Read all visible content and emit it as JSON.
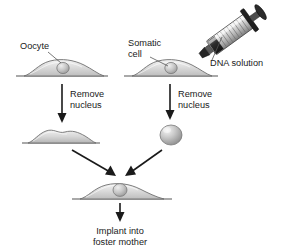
{
  "diagram": {
    "background_color": "#ffffff",
    "text_color": "#1a1a1a",
    "cell_fill_color": "#d5d5d5",
    "nucleus_fill_color": "#b8b8b8",
    "baseline_color": "#8d8d8d",
    "arrow_color": "#1a1a1a",
    "leader_color": "#555555"
  },
  "labels": {
    "oocyte": "Oocyte",
    "somatic_cell_line1": "Somatic",
    "somatic_cell_line2": "cell",
    "dna_solution": "DNA solution",
    "remove_nucleus_left_line1": "Remove",
    "remove_nucleus_left_line2": "nucleus",
    "remove_nucleus_right_line1": "Remove",
    "remove_nucleus_right_line2": "nucleus",
    "implant_line1": "Implant into",
    "implant_line2": "foster mother"
  },
  "steps": [
    {
      "id": "oocyte",
      "label": "Oocyte",
      "stage": "source-cell-left"
    },
    {
      "id": "somatic-cell",
      "label": "Somatic cell",
      "stage": "source-cell-right"
    },
    {
      "id": "dna-injection",
      "label": "DNA solution",
      "stage": "injection"
    },
    {
      "id": "enucleate-oocyte",
      "label": "Remove nucleus",
      "stage": "transition-left"
    },
    {
      "id": "enucleate-somatic",
      "label": "Remove nucleus",
      "stage": "transition-right"
    },
    {
      "id": "enucleated-oocyte",
      "label": "",
      "stage": "result-left"
    },
    {
      "id": "isolated-nucleus",
      "label": "",
      "stage": "result-right"
    },
    {
      "id": "reconstructed-cell",
      "label": "",
      "stage": "merge"
    },
    {
      "id": "implantation",
      "label": "Implant into foster mother",
      "stage": "final"
    }
  ]
}
